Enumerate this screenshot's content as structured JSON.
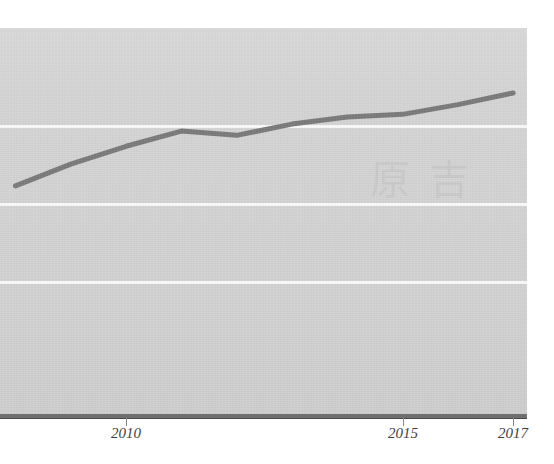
{
  "chart_data": {
    "type": "line",
    "title": "",
    "subtitle": "",
    "xlabel": "",
    "ylabel": "",
    "x": [
      2008,
      2009,
      2010,
      2011,
      2012,
      2013,
      2014,
      2015,
      2016,
      2017
    ],
    "series": [
      {
        "name": "trend",
        "color": "#7b7b7b",
        "values": [
          59.4,
          65.0,
          69.6,
          73.5,
          72.4,
          75.3,
          77.1,
          77.8,
          80.3,
          83.3
        ]
      }
    ],
    "categories": [
      "2008",
      "2009",
      "2010",
      "2011",
      "2012",
      "2013",
      "2014",
      "2015",
      "2016",
      "2017"
    ],
    "xticks": [
      {
        "label": "2010",
        "x": 2010
      },
      {
        "label": "2015",
        "x": 2015
      },
      {
        "label": "2017",
        "x": 2017
      }
    ],
    "xlim": [
      2007.72,
      2017.25
    ],
    "ylim": [
      0,
      100
    ],
    "gridlines": {
      "visible": true,
      "color": "#fbfbfb",
      "y_values": [
        75,
        55,
        35
      ]
    },
    "legend": {
      "visible": false,
      "position": "none"
    },
    "grid": true,
    "plot_background": "#d5d5d5",
    "page_background": "#ffffff",
    "axis_color": "#6f6f6f",
    "line_width_px": 5,
    "watermark": "原 吉"
  },
  "axis": {
    "ticks": [
      {
        "label": "2010"
      },
      {
        "label": "2015"
      },
      {
        "label": "2017"
      }
    ]
  }
}
